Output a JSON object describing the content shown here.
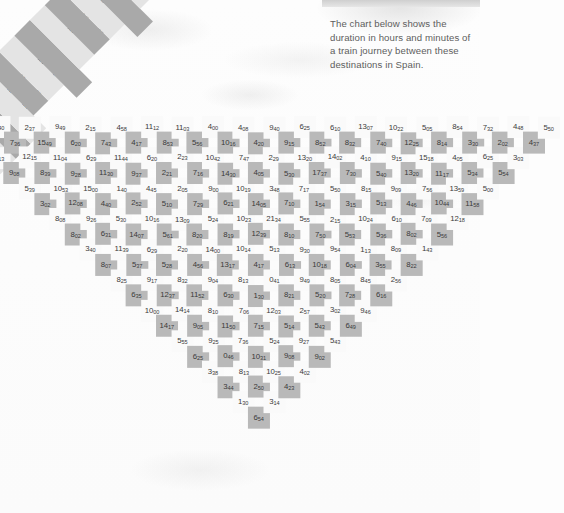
{
  "intro": {
    "text": "The chart below shows the duration in hours and minutes of a train journey between these destinations in Spain."
  },
  "colors": {
    "cell_light": "#fafafa",
    "cell_dark": "#b9b9b9",
    "header_light": "#e4e4e4",
    "header_dark": "#a9a9a9",
    "text": "#3a3a3a",
    "page_background": "#fdfdfd"
  },
  "chart_data": {
    "type": "table",
    "note": "Triangular distance-matrix; values are durations in hours and minutes (e.g. 438 = 4h38m).",
    "categories": [
      {
        "name": "Alicante",
        "qualifier": "(Terminal)"
      },
      {
        "name": "Barcelona",
        "qualifier": "(Sants)"
      },
      {
        "name": "Bilbao",
        "qualifier": "(Abando)"
      },
      {
        "name": "Burgos",
        "qualifier": ""
      },
      {
        "name": "Cádiz",
        "qualifier": ""
      },
      {
        "name": "Córdoba",
        "qualifier": "(Central)"
      },
      {
        "name": "Cuenca",
        "qualifier": ""
      },
      {
        "name": "Granada",
        "qualifier": ""
      },
      {
        "name": "León",
        "qualifier": ""
      },
      {
        "name": "Madrid",
        "qualifier": "(Chamartín/Atocha)"
      },
      {
        "name": "Málaga",
        "qualifier": ""
      },
      {
        "name": "Pamplona",
        "qualifier": ""
      },
      {
        "name": "Salamanca",
        "qualifier": ""
      },
      {
        "name": "Santander",
        "qualifier": ""
      },
      {
        "name": "Santiago de",
        "qualifier": "Compostela"
      },
      {
        "name": "Segovia",
        "qualifier": ""
      },
      {
        "name": "Seville",
        "qualifier": "(Santa Justa)"
      },
      {
        "name": "Tarragona",
        "qualifier": ""
      },
      {
        "name": "Toledo",
        "qualifier": ""
      },
      {
        "name": "Valencia",
        "qualifier": "(Estación Norte)"
      },
      {
        "name": "Zaragoza",
        "qualifier": "(El Portillo)"
      }
    ],
    "rows": [
      {
        "label": "Barcelona (Sants)",
        "values": [
          "438"
        ]
      },
      {
        "label": "Bilbao (Abando)",
        "values": [
          "1055",
          "840"
        ]
      },
      {
        "label": "Burgos",
        "values": [
          "813",
          "736",
          "237"
        ]
      },
      {
        "label": "Cádiz",
        "values": [
          "908",
          "1215",
          "1549",
          "949"
        ]
      },
      {
        "label": "Córdoba (Central)",
        "values": [
          "539",
          "839",
          "1104",
          "620",
          "215"
        ]
      },
      {
        "label": "Cuenca",
        "values": [
          "302",
          "1053",
          "928",
          "629",
          "743",
          "458"
        ]
      },
      {
        "label": "Granada",
        "values": [
          "808",
          "1208",
          "1500",
          "1130",
          "1144",
          "417",
          "1112"
        ]
      },
      {
        "label": "León",
        "values": [
          "802",
          "926",
          "440",
          "140",
          "937",
          "620",
          "853",
          "1103"
        ]
      },
      {
        "label": "Madrid (Chamartín/Atocha)",
        "values": [
          "340",
          "631",
          "530",
          "252",
          "445",
          "221",
          "223",
          "556",
          "400"
        ]
      },
      {
        "label": "Málaga",
        "values": [
          "807",
          "1139",
          "1407",
          "1016",
          "510",
          "205",
          "716",
          "1042",
          "1016",
          "408"
        ]
      },
      {
        "label": "Pamplona",
        "values": [
          "825",
          "537",
          "629",
          "561",
          "1309",
          "729",
          "900",
          "1430",
          "747",
          "420",
          "940"
        ]
      },
      {
        "label": "Salamanca",
        "values": [
          "635",
          "917",
          "528",
          "220",
          "820",
          "524",
          "621",
          "1019",
          "405",
          "229",
          "915",
          "625"
        ]
      },
      {
        "label": "Santander",
        "values": [
          "1000",
          "1237",
          "832",
          "456",
          "1400",
          "819",
          "1023",
          "1405",
          "348",
          "530",
          "1320",
          "852",
          "610"
        ]
      },
      {
        "label": "Santiago de Compostela",
        "values": [
          "1417",
          "1414",
          "1152",
          "904",
          "1317",
          "1014",
          "1239",
          "2134",
          "710",
          "717",
          "1737",
          "1402",
          "832",
          "1307"
        ]
      },
      {
        "label": "Segovia",
        "values": [
          "555",
          "905",
          "810",
          "630",
          "813",
          "417",
          "513",
          "810",
          "555",
          "154",
          "550",
          "730",
          "410",
          "740",
          "1022"
        ]
      },
      {
        "label": "Seville (Santa Justa)",
        "values": [
          "625",
          "925",
          "1150",
          "706",
          "130",
          "041",
          "613",
          "930",
          "750",
          "215",
          "315",
          "815",
          "540",
          "915",
          "1225",
          "505"
        ]
      },
      {
        "label": "Tarragona",
        "values": [
          "338",
          "046",
          "736",
          "715",
          "1203",
          "821",
          "949",
          "1018",
          "954",
          "553",
          "1024",
          "513",
          "909",
          "1320",
          "1518",
          "814",
          "854"
        ]
      },
      {
        "label": "Toledo",
        "values": [
          "344",
          "813",
          "1031",
          "524",
          "514",
          "257",
          "520",
          "805",
          "604",
          "113",
          "536",
          "610",
          "446",
          "756",
          "1117",
          "405",
          "330",
          "732"
        ]
      },
      {
        "label": "Valencia (Estación Norte)",
        "values": [
          "130",
          "250",
          "1025",
          "908",
          "927",
          "543",
          "302",
          "728",
          "845",
          "355",
          "809",
          "802",
          "709",
          "1044",
          "1359",
          "534",
          "625",
          "202",
          "448"
        ]
      },
      {
        "label": "Zaragoza (El Portillo)",
        "values": [
          "654",
          "314",
          "423",
          "402",
          "902",
          "543",
          "649",
          "946",
          "616",
          "256",
          "822",
          "143",
          "556",
          "1218",
          "1158",
          "500",
          "554",
          "303",
          "437",
          "550"
        ]
      }
    ]
  }
}
